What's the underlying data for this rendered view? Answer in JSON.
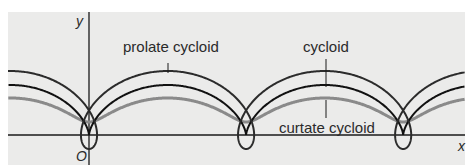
{
  "figure": {
    "axes": {
      "x_label": "x",
      "y_label": "y",
      "origin_label": "O"
    },
    "curves": [
      {
        "name": "prolate cycloid",
        "label": "prolate cycloid",
        "color": "#2b2b2b",
        "radius": 25,
        "distance": 39
      },
      {
        "name": "cycloid",
        "label": "cycloid",
        "color": "#111111",
        "radius": 25,
        "distance": 25
      },
      {
        "name": "curtate cycloid",
        "label": "curtate cycloid",
        "color": "#8a8a8a",
        "radius": 25,
        "distance": 12
      }
    ],
    "colors": {
      "panel": "#ebebea",
      "axis": "#1a1a1a"
    }
  }
}
